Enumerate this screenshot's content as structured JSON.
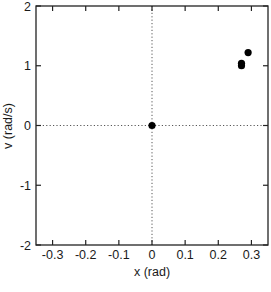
{
  "chart_data": {
    "type": "scatter",
    "title": "",
    "xlabel": "x (rad)",
    "ylabel": "v (rad/s)",
    "xlim": [
      -0.35,
      0.35
    ],
    "ylim": [
      -2,
      2
    ],
    "xticks": [
      -0.3,
      -0.2,
      -0.1,
      0,
      0.1,
      0.2,
      0.3
    ],
    "xtick_labels": [
      "-0.3",
      "-0.2",
      "-0.1",
      "0",
      "0.1",
      "0.2",
      "0.3"
    ],
    "yticks": [
      -2,
      -1,
      0,
      1,
      2
    ],
    "ytick_labels": [
      "-2",
      "-1",
      "0",
      "1",
      "2"
    ],
    "grid": false,
    "reference_lines": [
      {
        "orientation": "vertical",
        "value": 0,
        "style": "dotted"
      },
      {
        "orientation": "horizontal",
        "value": 0,
        "style": "dotted"
      }
    ],
    "legend": null,
    "series": [
      {
        "name": "points",
        "marker": "filled-circle",
        "color": "#000000",
        "points": [
          {
            "x": 0.0,
            "y": 0.0
          },
          {
            "x": 0.27,
            "y": 1.0
          },
          {
            "x": 0.27,
            "y": 1.04
          },
          {
            "x": 0.29,
            "y": 1.22
          }
        ]
      }
    ]
  }
}
